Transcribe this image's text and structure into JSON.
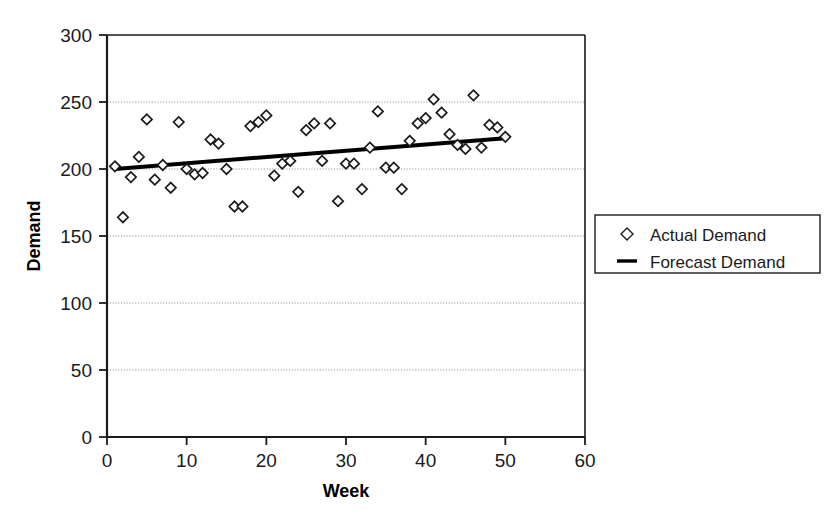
{
  "chart_data": {
    "type": "scatter",
    "title": "",
    "xlabel": "Week",
    "ylabel": "Demand",
    "xlim": [
      0,
      60
    ],
    "ylim": [
      0,
      300
    ],
    "xticks": [
      0,
      10,
      20,
      30,
      40,
      50,
      60
    ],
    "yticks": [
      0,
      50,
      100,
      150,
      200,
      250,
      300
    ],
    "grid": true,
    "grid_axis": "y",
    "legend_position": "right",
    "series": [
      {
        "name": "Actual Demand",
        "marker": "diamond",
        "type": "scatter",
        "x": [
          1,
          2,
          3,
          4,
          5,
          6,
          7,
          8,
          9,
          10,
          11,
          12,
          13,
          14,
          15,
          16,
          17,
          18,
          19,
          20,
          21,
          22,
          23,
          24,
          25,
          26,
          27,
          28,
          29,
          30,
          31,
          32,
          33,
          34,
          35,
          36,
          37,
          38,
          39,
          40,
          41,
          42,
          43,
          44,
          45,
          46,
          47,
          48,
          49,
          50
        ],
        "y": [
          202,
          164,
          194,
          209,
          237,
          192,
          203,
          186,
          235,
          200,
          196,
          197,
          222,
          219,
          200,
          172,
          172,
          232,
          235,
          240,
          195,
          204,
          206,
          183,
          229,
          234,
          206,
          234,
          176,
          204,
          204,
          185,
          216,
          243,
          201,
          201,
          185,
          221,
          234,
          238,
          252,
          242,
          226,
          218,
          215,
          255,
          216,
          233,
          231,
          224
        ]
      },
      {
        "name": "Forecast Demand",
        "marker": "line",
        "type": "line",
        "x": [
          1,
          50
        ],
        "y": [
          200,
          223
        ]
      }
    ]
  },
  "legend": {
    "items": [
      {
        "label": "Actual Demand",
        "marker": "diamond"
      },
      {
        "label": "Forecast Demand",
        "marker": "line"
      }
    ]
  },
  "axes": {
    "x_title": "Week",
    "y_title": "Demand",
    "x_tick_labels": [
      "0",
      "10",
      "20",
      "30",
      "40",
      "50",
      "60"
    ],
    "y_tick_labels": [
      "0",
      "50",
      "100",
      "150",
      "200",
      "250",
      "300"
    ]
  },
  "colors": {
    "axis": "#1a1a1a",
    "grid": "#9a9a9a",
    "marker": "#1a1a1a",
    "line": "#000000",
    "background": "#ffffff"
  }
}
